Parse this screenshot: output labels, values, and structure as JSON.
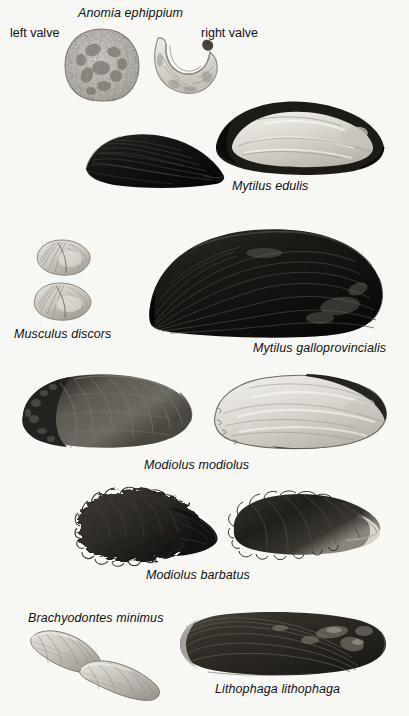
{
  "plate": {
    "background_color": "#f7f7f4",
    "ink_color": "#111111",
    "width": 409,
    "height": 716
  },
  "labels": {
    "anomia_title": "Anomia ephippium",
    "left_valve": "left valve",
    "right_valve": "right valve",
    "mytilus_edulis": "Mytilus edulis",
    "musculus_discors": "Musculus discors",
    "mytilus_galloprovincialis": "Mytilus galloprovincialis",
    "modiolus_modiolus": "Modiolus modiolus",
    "modiolus_barbatus": "Modiolus barbatus",
    "brachyodontes_minimus": "Brachyodontes minimus",
    "lithophaga_lithophaga": "Lithophaga lithophaga"
  },
  "specimens": [
    {
      "id": "anomia-left-valve",
      "species": "Anomia ephippium",
      "view": "left valve",
      "shape": "rough circular disc, mottled light grey with dark blotches, crenulate margin",
      "tone": "light mottled",
      "x": 64,
      "y": 28,
      "width": 76,
      "height": 74
    },
    {
      "id": "anomia-right-valve",
      "species": "Anomia ephippium",
      "view": "right valve",
      "shape": "crescent / saddle shaped valve with byssal notch, pale",
      "tone": "pale",
      "x": 150,
      "y": 32,
      "width": 68,
      "height": 62
    },
    {
      "id": "mytilus-edulis-exterior",
      "species": "Mytilus edulis",
      "view": "exterior",
      "shape": "dark wedge shaped mussel, umbo at right, fan of growth lines",
      "tone": "very dark",
      "x": 84,
      "y": 133,
      "width": 140,
      "height": 57
    },
    {
      "id": "mytilus-edulis-interior",
      "species": "Mytilus edulis",
      "view": "interior",
      "shape": "mussel interior, dark margin with pale nacre centre, pointed umbo at left",
      "tone": "pale nacre with dark rim",
      "x": 206,
      "y": 100,
      "width": 178,
      "height": 74
    },
    {
      "id": "musculus-discors-upper",
      "species": "Musculus discors",
      "view": "upper specimen",
      "shape": "small oval shell with radiating ribs on anterior slope",
      "tone": "light grey",
      "x": 34,
      "y": 240,
      "width": 56,
      "height": 35
    },
    {
      "id": "musculus-discors-lower",
      "species": "Musculus discors",
      "view": "lower specimen",
      "shape": "small oval shell with radiating ribs on anterior slope",
      "tone": "light grey",
      "x": 32,
      "y": 283,
      "width": 58,
      "height": 36
    },
    {
      "id": "mytilus-galloprovincialis",
      "species": "Mytilus galloprovincialis",
      "view": "exterior",
      "shape": "large dark mussel, pointed umbo lower left, broad rounded posterior right",
      "tone": "very dark",
      "x": 146,
      "y": 228,
      "width": 238,
      "height": 112
    },
    {
      "id": "modiolus-modiolus-exterior",
      "species": "Modiolus modiolus",
      "view": "exterior",
      "shape": "oblong mussel, dark rough anterior, smoother grey posterior",
      "tone": "dark grey",
      "x": 20,
      "y": 372,
      "width": 172,
      "height": 78
    },
    {
      "id": "modiolus-modiolus-interior",
      "species": "Modiolus modiolus",
      "view": "interior",
      "shape": "oblong mussel interior, pale cream nacre with thin dark margin",
      "tone": "pale",
      "x": 212,
      "y": 374,
      "width": 176,
      "height": 78
    },
    {
      "id": "modiolus-barbatus-bristly",
      "species": "Modiolus barbatus",
      "view": "exterior with periostracal bristles",
      "shape": "mussel densely covered with hair like bristles, pointed at right",
      "tone": "dark fuzzy",
      "x": 76,
      "y": 488,
      "width": 148,
      "height": 74
    },
    {
      "id": "modiolus-barbatus-right",
      "species": "Modiolus barbatus",
      "view": "exterior",
      "shape": "mussel with fringe of bristles along margin, pale posterior tip at right",
      "tone": "dark with pale tip",
      "x": 228,
      "y": 492,
      "width": 152,
      "height": 66
    },
    {
      "id": "brachyodontes-minimus-upper",
      "species": "Brachyodontes minimus",
      "view": "upper specimen",
      "shape": "small elongate pale mussel, inclined down to the right",
      "tone": "light grey",
      "x": 28,
      "y": 630,
      "width": 72,
      "height": 42
    },
    {
      "id": "brachyodontes-minimus-lower",
      "species": "Brachyodontes minimus",
      "view": "lower specimen",
      "shape": "small elongate pale mussel, inclined down to the right",
      "tone": "light grey",
      "x": 78,
      "y": 660,
      "width": 82,
      "height": 40
    },
    {
      "id": "lithophaga-lithophaga",
      "species": "Lithophaga lithophaga",
      "view": "exterior",
      "shape": "long cylindrical date mussel, rounded ends, concentric growth lines",
      "tone": "dark brown grey",
      "x": 178,
      "y": 612,
      "width": 208,
      "height": 64
    }
  ]
}
